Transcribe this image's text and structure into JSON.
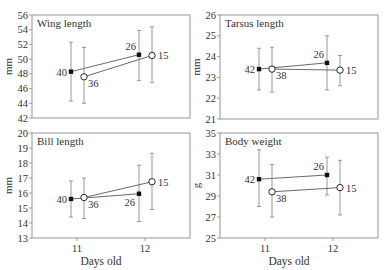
{
  "chart_data": [
    {
      "type": "line",
      "title": "Wing length",
      "xlabel": "",
      "ylabel": "mm",
      "categories": [
        "11",
        "12"
      ],
      "ylim": [
        42,
        56
      ],
      "yticks": [
        42,
        44,
        46,
        48,
        50,
        52,
        54,
        56
      ],
      "series": [
        {
          "name": "filled",
          "marker": "filled-circle",
          "values": [
            48.3,
            50.6
          ],
          "err_low": [
            44.3,
            47.1
          ],
          "err_high": [
            52.3,
            53.9
          ],
          "n": [
            40,
            26
          ]
        },
        {
          "name": "open",
          "marker": "open-circle",
          "values": [
            47.6,
            50.5
          ],
          "err_low": [
            44.0,
            46.8
          ],
          "err_high": [
            51.6,
            54.4
          ],
          "n": [
            36,
            15
          ]
        }
      ]
    },
    {
      "type": "line",
      "title": "Tarsus length",
      "xlabel": "",
      "ylabel": "mm",
      "categories": [
        "11",
        "12"
      ],
      "ylim": [
        21,
        26
      ],
      "yticks": [
        21,
        22,
        23,
        24,
        25,
        26
      ],
      "series": [
        {
          "name": "filled",
          "marker": "filled-circle",
          "values": [
            23.4,
            23.7
          ],
          "err_low": [
            22.4,
            22.4
          ],
          "err_high": [
            24.4,
            25.0
          ],
          "n": [
            42,
            26
          ]
        },
        {
          "name": "open",
          "marker": "open-circle",
          "values": [
            23.4,
            23.35
          ],
          "err_low": [
            22.3,
            22.6
          ],
          "err_high": [
            24.45,
            24.05
          ],
          "n": [
            38,
            15
          ]
        }
      ]
    },
    {
      "type": "line",
      "title": "Bill length",
      "xlabel": "Days old",
      "ylabel": "mm",
      "categories": [
        "11",
        "12"
      ],
      "ylim": [
        13,
        20
      ],
      "yticks": [
        13,
        14,
        15,
        16,
        17,
        18,
        19,
        20
      ],
      "series": [
        {
          "name": "filled",
          "marker": "filled-circle",
          "values": [
            15.6,
            15.95
          ],
          "err_low": [
            14.4,
            14.1
          ],
          "err_high": [
            16.8,
            17.85
          ],
          "n": [
            40,
            26
          ]
        },
        {
          "name": "open",
          "marker": "open-circle",
          "values": [
            15.7,
            16.75
          ],
          "err_low": [
            14.3,
            14.9
          ],
          "err_high": [
            17.0,
            18.65
          ],
          "n": [
            36,
            15
          ]
        }
      ]
    },
    {
      "type": "line",
      "title": "Body weight",
      "xlabel": "Days old",
      "ylabel": "g",
      "categories": [
        "11",
        "12"
      ],
      "ylim": [
        25,
        35
      ],
      "yticks": [
        25,
        27,
        29,
        31,
        33,
        35
      ],
      "series": [
        {
          "name": "filled",
          "marker": "filled-circle",
          "values": [
            30.6,
            31.0
          ],
          "err_low": [
            28.0,
            29.1
          ],
          "err_high": [
            33.4,
            32.7
          ],
          "n": [
            42,
            26
          ]
        },
        {
          "name": "open",
          "marker": "open-circle",
          "values": [
            29.4,
            29.8
          ],
          "err_low": [
            27.0,
            27.2
          ],
          "err_high": [
            32.0,
            32.4
          ],
          "n": [
            38,
            15
          ]
        }
      ]
    }
  ],
  "panels": [
    {
      "title": "Wing length",
      "ylabel": "mm"
    },
    {
      "title": "Tarsus length",
      "ylabel": "mm"
    },
    {
      "title": "Bill length",
      "ylabel": "mm",
      "xlabel": "Days old"
    },
    {
      "title": "Body weight",
      "ylabel": "g",
      "xlabel": "Days old"
    }
  ],
  "colors": {
    "frame": "#8a8a8a",
    "errorbar": "#8c8c8c",
    "marker": "#111111",
    "text": "#333333"
  }
}
